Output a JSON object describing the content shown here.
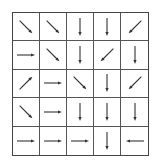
{
  "grid": {
    "rows": 5,
    "cols": 5,
    "arrows": [
      [
        "SE",
        "SE",
        "S",
        "S",
        "SW"
      ],
      [
        "E",
        "SE",
        "S",
        "SW",
        "S"
      ],
      [
        "NE",
        "E",
        "SE",
        "S",
        "SW"
      ],
      [
        "SE",
        "E",
        "S",
        "S",
        "S"
      ],
      [
        "E",
        "E",
        "E",
        "S",
        "W"
      ]
    ]
  },
  "colors": {
    "line": "#444444",
    "arrow": "#333333",
    "background": "#ffffff"
  }
}
